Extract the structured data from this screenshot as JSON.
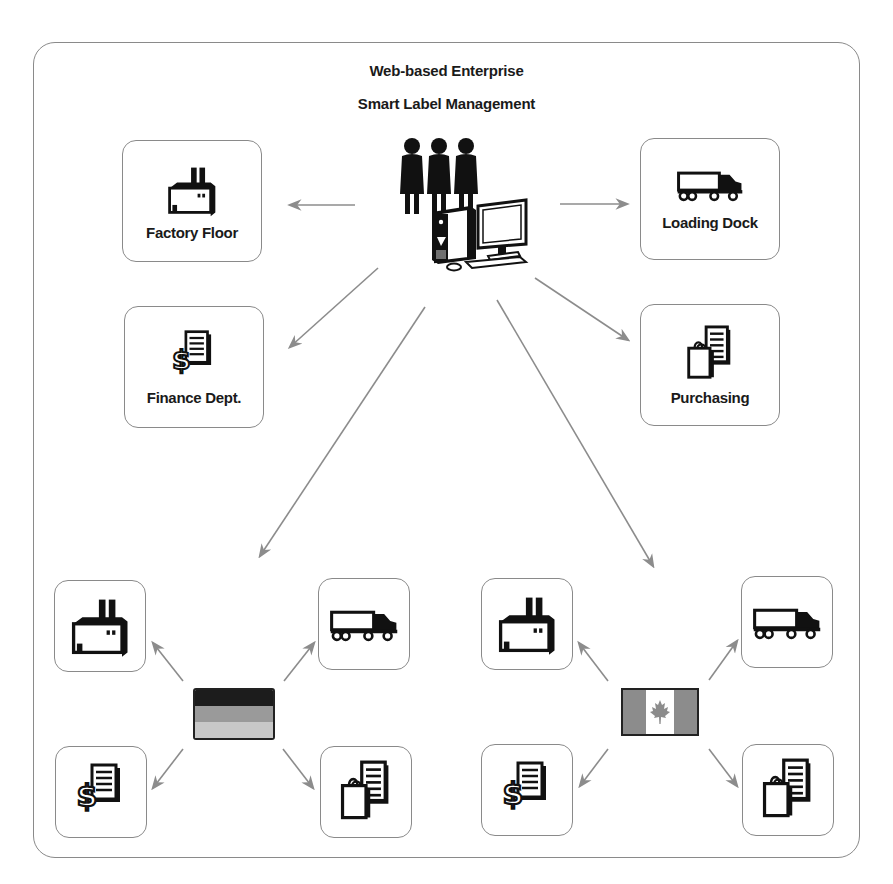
{
  "header": {
    "title_line1": "Web-based Enterprise",
    "title_line2": "Smart Label Management"
  },
  "hub": {
    "icon": "users-with-computer-icon",
    "description": "Three people standing behind a desktop computer"
  },
  "departments": [
    {
      "id": "factory",
      "label": "Factory Floor",
      "icon": "factory-icon"
    },
    {
      "id": "loading",
      "label": "Loading Dock",
      "icon": "truck-icon"
    },
    {
      "id": "finance",
      "label": "Finance Dept.",
      "icon": "finance-document-icon"
    },
    {
      "id": "purchasing",
      "label": "Purchasing",
      "icon": "shopping-bag-document-icon"
    }
  ],
  "regions": [
    {
      "id": "germany",
      "flag": "germany-flag-icon",
      "flag_colors": [
        "#1c1c1c",
        "#9a9a9a",
        "#c8c8c8"
      ],
      "nodes": [
        "factory-icon",
        "truck-icon",
        "finance-document-icon",
        "shopping-bag-document-icon"
      ]
    },
    {
      "id": "canada",
      "flag": "canada-flag-icon",
      "flag_colors": [
        "#8c8c8c",
        "#ffffff",
        "#8c8c8c"
      ],
      "nodes": [
        "factory-icon",
        "truck-icon",
        "finance-document-icon",
        "shopping-bag-document-icon"
      ]
    }
  ],
  "colors": {
    "border": "#8a8a8a",
    "arrow": "#8c8c8c",
    "icon": "#111111",
    "text": "#1a1a1a"
  }
}
